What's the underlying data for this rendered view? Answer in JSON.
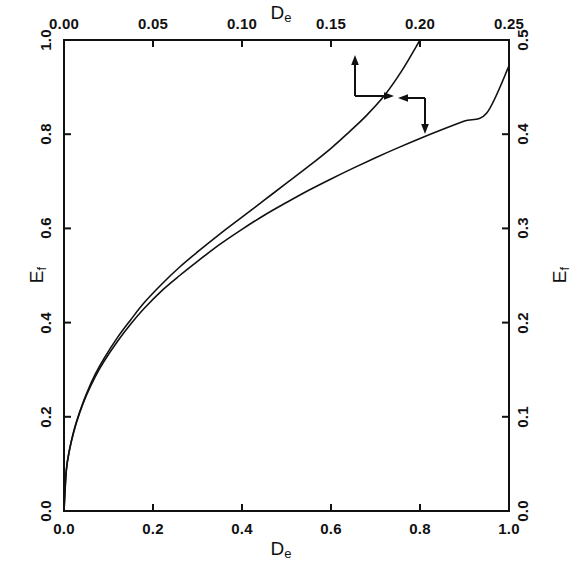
{
  "figure": {
    "background_color": "#ffffff",
    "line_color": "#111111",
    "frame": {
      "left": 64,
      "top": 40,
      "right": 509,
      "bottom": 511
    }
  },
  "axes": {
    "bottom": {
      "title": "D",
      "title_sub": "e",
      "tick_labels": [
        "0.0",
        "0.2",
        "0.4",
        "0.6",
        "0.8",
        "1.0"
      ],
      "range": [
        0.0,
        1.0
      ]
    },
    "top": {
      "title": "D",
      "title_sub": "e",
      "tick_labels": [
        "0.00",
        "0.05",
        "0.10",
        "0.15",
        "0.20",
        "0.25"
      ],
      "range": [
        0.0,
        0.25
      ]
    },
    "left": {
      "title": "E",
      "title_sub": "f",
      "tick_labels": [
        "0.0",
        "0.2",
        "0.4",
        "0.6",
        "0.8",
        "1.0"
      ],
      "range": [
        0.0,
        1.0
      ]
    },
    "right": {
      "title": "E",
      "title_sub": "f",
      "tick_labels": [
        "0.0",
        "0.1",
        "0.2",
        "0.3",
        "0.4",
        "0.5"
      ],
      "range": [
        0.0,
        0.5
      ]
    }
  },
  "annotations": [
    {
      "name": "upper-curve-axis-pointer",
      "description": "arrows pointing up and right, indicating upper curve reads against top and right axes",
      "arrow_up": true,
      "arrow_right": true,
      "arrow_left": false,
      "arrow_down": false
    },
    {
      "name": "lower-curve-axis-pointer",
      "description": "arrows pointing left and down, indicating lower curve reads against bottom and left axes",
      "arrow_up": false,
      "arrow_right": false,
      "arrow_left": true,
      "arrow_down": true
    }
  ],
  "chart_data": {
    "type": "line",
    "title": "",
    "xlabel": "D_e",
    "ylabel": "E_f",
    "xlim": [
      0.0,
      1.0
    ],
    "ylim": [
      0.0,
      1.0
    ],
    "grid": false,
    "legend": "none",
    "secondary_xlim": [
      0.0,
      0.25
    ],
    "secondary_ylim": [
      0.0,
      0.5
    ],
    "series": [
      {
        "name": "lower curve (bottom/left axes)",
        "axis_x": "bottom",
        "axis_y": "left",
        "x": [
          0.0,
          0.005,
          0.012,
          0.022,
          0.035,
          0.05,
          0.07,
          0.09,
          0.12,
          0.15,
          0.18,
          0.22,
          0.26,
          0.3,
          0.35,
          0.4,
          0.45,
          0.5,
          0.55,
          0.6,
          0.65,
          0.7,
          0.75,
          0.8,
          0.85,
          0.9,
          0.95,
          1.0
        ],
        "y": [
          0.0,
          0.085,
          0.128,
          0.168,
          0.208,
          0.245,
          0.285,
          0.318,
          0.36,
          0.397,
          0.43,
          0.468,
          0.5,
          0.53,
          0.566,
          0.598,
          0.628,
          0.655,
          0.681,
          0.705,
          0.728,
          0.75,
          0.771,
          0.791,
          0.81,
          0.828,
          0.845,
          0.945
        ]
      },
      {
        "name": "upper curve (top/right axes)",
        "axis_x": "top",
        "axis_y": "right",
        "x": [
          0.0,
          0.0013,
          0.003,
          0.0055,
          0.0088,
          0.0125,
          0.0175,
          0.0225,
          0.03,
          0.0375,
          0.045,
          0.055,
          0.065,
          0.075,
          0.0875,
          0.1,
          0.1125,
          0.125,
          0.1375,
          0.15,
          0.16,
          0.17,
          0.18,
          0.19,
          0.2
        ],
        "y": [
          0.0,
          0.043,
          0.064,
          0.085,
          0.105,
          0.124,
          0.145,
          0.162,
          0.184,
          0.203,
          0.221,
          0.241,
          0.259,
          0.275,
          0.294,
          0.312,
          0.33,
          0.348,
          0.366,
          0.385,
          0.402,
          0.42,
          0.441,
          0.468,
          0.5
        ]
      }
    ],
    "crossing_point": {
      "x": 0.3,
      "y": 0.61
    }
  }
}
